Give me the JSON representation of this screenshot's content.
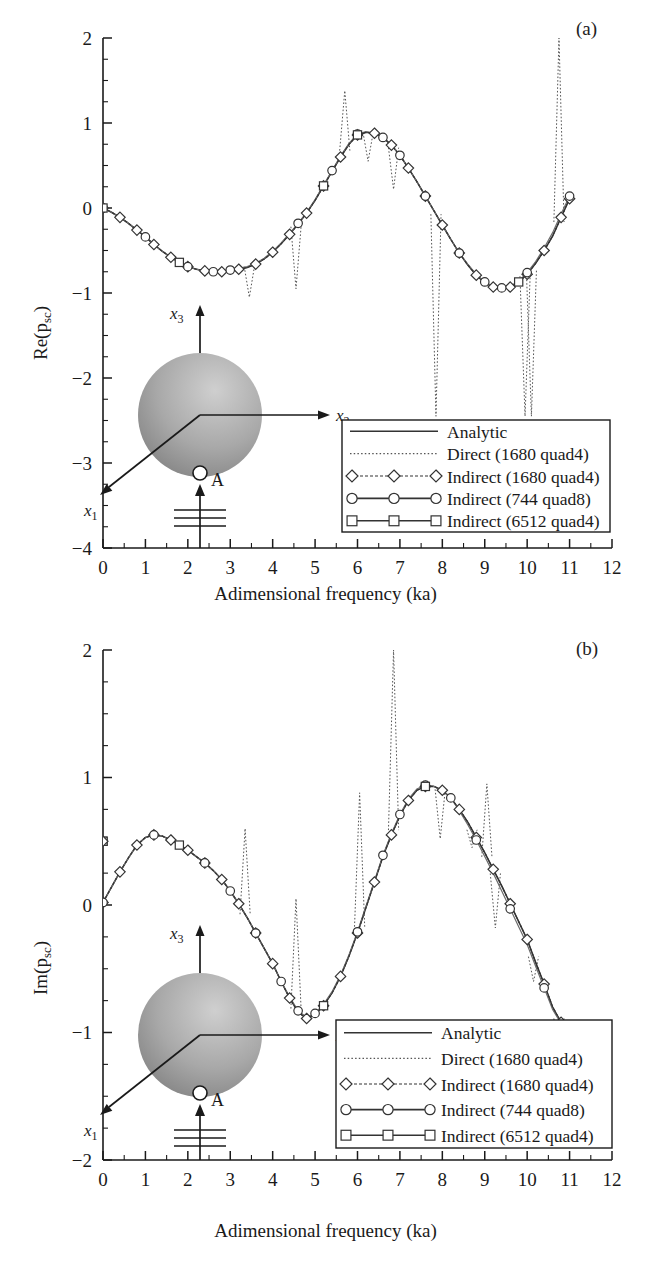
{
  "figure": {
    "panels": [
      {
        "id": "a",
        "label": "(a)",
        "ylabel_main": "Re(p",
        "ylabel_sub": "sc",
        "ylabel_close": ")",
        "xlabel": "Adimensional frequency (ka)"
      },
      {
        "id": "b",
        "label": "(b)",
        "ylabel_main": "Im(p",
        "ylabel_sub": "sc",
        "ylabel_close": ")",
        "xlabel": "Adimensional frequency (ka)"
      }
    ]
  },
  "legend": {
    "entries": [
      {
        "label": "Analytic",
        "style": "solid",
        "marker": "none"
      },
      {
        "label": "Direct (1680 quad4)",
        "style": "dotted",
        "marker": "none"
      },
      {
        "label": "Indirect (1680 quad4)",
        "style": "dashed",
        "marker": "diamond"
      },
      {
        "label": "Indirect (744 quad8)",
        "style": "solid",
        "marker": "circle"
      },
      {
        "label": "Indirect (6512 quad4)",
        "style": "solid",
        "marker": "square"
      }
    ]
  },
  "inset": {
    "axis_x1_main": "x",
    "axis_x1_sub": "1",
    "axis_x2_main": "x",
    "axis_x2_sub": "2",
    "axis_x3_main": "x",
    "axis_x3_sub": "3",
    "point_label": "A"
  },
  "colors": {
    "ink": "#1a1a1a",
    "curve": "#333333",
    "dotted": "#555555",
    "sphere_light": "#cfcfcf",
    "sphere_dark": "#7d7d7d"
  },
  "chart_data": [
    {
      "type": "line",
      "panel": "a",
      "title": "(a)",
      "xlabel": "Adimensional frequency (ka)",
      "ylabel": "Re(p_sc)",
      "xlim": [
        0,
        12
      ],
      "ylim": [
        -4,
        2
      ],
      "xticks": [
        0,
        1,
        2,
        3,
        4,
        5,
        6,
        7,
        8,
        9,
        10,
        11,
        12
      ],
      "yticks": [
        -4,
        -3,
        -2,
        -1,
        0,
        1,
        2
      ],
      "xminor_step": 0.5,
      "yminor_step": 0.25,
      "grid": false,
      "legend_position": "lower-right",
      "x": [
        0,
        0.2,
        0.4,
        0.6,
        0.8,
        1.0,
        1.2,
        1.4,
        1.6,
        1.8,
        2.0,
        2.2,
        2.4,
        2.6,
        2.8,
        3.0,
        3.2,
        3.4,
        3.6,
        3.8,
        4.0,
        4.2,
        4.4,
        4.6,
        4.8,
        5.0,
        5.2,
        5.4,
        5.6,
        5.8,
        6.0,
        6.2,
        6.4,
        6.6,
        6.8,
        7.0,
        7.2,
        7.4,
        7.6,
        7.8,
        8.0,
        8.2,
        8.4,
        8.6,
        8.8,
        9.0,
        9.2,
        9.4,
        9.6,
        9.8,
        10.0,
        10.2,
        10.4,
        10.6,
        10.8,
        11.0
      ],
      "series": [
        {
          "name": "Analytic",
          "values": [
            0.0,
            -0.05,
            -0.11,
            -0.18,
            -0.26,
            -0.34,
            -0.43,
            -0.51,
            -0.58,
            -0.64,
            -0.69,
            -0.72,
            -0.74,
            -0.75,
            -0.75,
            -0.74,
            -0.72,
            -0.7,
            -0.66,
            -0.6,
            -0.52,
            -0.42,
            -0.31,
            -0.19,
            -0.06,
            0.09,
            0.26,
            0.43,
            0.6,
            0.75,
            0.86,
            0.89,
            0.88,
            0.83,
            0.74,
            0.62,
            0.47,
            0.31,
            0.14,
            -0.03,
            -0.2,
            -0.37,
            -0.53,
            -0.67,
            -0.79,
            -0.88,
            -0.93,
            -0.95,
            -0.93,
            -0.87,
            -0.78,
            -0.65,
            -0.5,
            -0.33,
            -0.11,
            0.11
          ]
        },
        {
          "name": "Indirect (1680 quad4)",
          "values": [
            0.0,
            -0.05,
            -0.11,
            -0.18,
            -0.26,
            -0.34,
            -0.43,
            -0.51,
            -0.58,
            -0.64,
            -0.69,
            -0.72,
            -0.74,
            -0.75,
            -0.75,
            -0.74,
            -0.72,
            -0.7,
            -0.66,
            -0.6,
            -0.52,
            -0.42,
            -0.31,
            -0.19,
            -0.06,
            0.09,
            0.26,
            0.43,
            0.6,
            0.75,
            0.86,
            0.89,
            0.88,
            0.83,
            0.74,
            0.62,
            0.47,
            0.31,
            0.14,
            -0.03,
            -0.2,
            -0.37,
            -0.53,
            -0.67,
            -0.79,
            -0.88,
            -0.93,
            -0.95,
            -0.93,
            -0.87,
            -0.78,
            -0.65,
            -0.5,
            -0.33,
            -0.11,
            0.11
          ]
        },
        {
          "name": "Indirect (744 quad8)",
          "values": [
            0.0,
            -0.05,
            -0.11,
            -0.18,
            -0.26,
            -0.34,
            -0.43,
            -0.51,
            -0.58,
            -0.64,
            -0.69,
            -0.72,
            -0.74,
            -0.75,
            -0.74,
            -0.73,
            -0.71,
            -0.69,
            -0.65,
            -0.59,
            -0.51,
            -0.41,
            -0.3,
            -0.18,
            -0.05,
            0.1,
            0.27,
            0.44,
            0.61,
            0.76,
            0.87,
            0.9,
            0.88,
            0.83,
            0.74,
            0.62,
            0.47,
            0.31,
            0.14,
            -0.03,
            -0.2,
            -0.37,
            -0.53,
            -0.66,
            -0.78,
            -0.87,
            -0.92,
            -0.94,
            -0.92,
            -0.86,
            -0.76,
            -0.63,
            -0.47,
            -0.29,
            -0.07,
            0.14
          ]
        },
        {
          "name": "Indirect (6512 quad4)",
          "values": [
            0.0,
            -0.05,
            -0.11,
            -0.18,
            -0.26,
            -0.34,
            -0.43,
            -0.51,
            -0.58,
            -0.64,
            -0.69,
            -0.72,
            -0.74,
            -0.75,
            -0.75,
            -0.74,
            -0.72,
            -0.7,
            -0.66,
            -0.6,
            -0.52,
            -0.42,
            -0.31,
            -0.19,
            -0.06,
            0.09,
            0.26,
            0.43,
            0.6,
            0.75,
            0.86,
            0.89,
            0.88,
            0.83,
            0.74,
            0.62,
            0.47,
            0.31,
            0.14,
            -0.03,
            -0.2,
            -0.37,
            -0.53,
            -0.67,
            -0.79,
            -0.88,
            -0.93,
            -0.95,
            -0.93,
            -0.87,
            -0.78,
            -0.65,
            -0.5,
            -0.33,
            -0.11,
            0.11
          ]
        },
        {
          "name": "Direct (1680 quad4)",
          "note": "follows Analytic with sharp resonance spikes at irreducible frequencies",
          "spikes": [
            {
              "ka": 3.45,
              "to": -1.05
            },
            {
              "ka": 4.55,
              "to": -0.95
            },
            {
              "ka": 5.7,
              "to": 1.38
            },
            {
              "ka": 6.25,
              "to": 0.55
            },
            {
              "ka": 6.85,
              "to": 0.22
            },
            {
              "ka": 7.85,
              "to": -2.45
            },
            {
              "ka": 9.95,
              "to": -2.45
            },
            {
              "ka": 10.1,
              "to": -2.45
            },
            {
              "ka": 10.75,
              "to": 2.0
            }
          ]
        }
      ],
      "marker_x_diamond": [
        0,
        0.4,
        0.8,
        1.2,
        1.6,
        2.0,
        2.4,
        2.8,
        3.2,
        3.6,
        4.0,
        4.4,
        4.8,
        5.2,
        5.6,
        6.0,
        6.4,
        6.8,
        7.2,
        7.6,
        8.0,
        8.4,
        8.8,
        9.2,
        9.6,
        10.0,
        10.4,
        10.8,
        11.0
      ],
      "marker_x_circle": [
        0,
        1.0,
        2.0,
        2.6,
        3.0,
        4.6,
        5.4,
        6.0,
        6.6,
        7.0,
        7.6,
        8.4,
        9.0,
        9.4,
        10.0,
        11.0
      ],
      "marker_x_square": [
        0,
        1.8,
        5.2,
        6.0,
        9.8
      ]
    },
    {
      "type": "line",
      "panel": "b",
      "title": "(b)",
      "xlabel": "Adimensional frequency (ka)",
      "ylabel": "Im(p_sc)",
      "xlim": [
        0,
        12
      ],
      "ylim": [
        -2,
        2
      ],
      "xticks": [
        0,
        1,
        2,
        3,
        4,
        5,
        6,
        7,
        8,
        9,
        10,
        11,
        12
      ],
      "yticks": [
        -2,
        -1,
        0,
        1,
        2
      ],
      "xminor_step": 0.5,
      "yminor_step": 0.25,
      "grid": false,
      "legend_position": "lower-right",
      "x": [
        0,
        0.2,
        0.4,
        0.6,
        0.8,
        1.0,
        1.2,
        1.4,
        1.6,
        1.8,
        2.0,
        2.2,
        2.4,
        2.6,
        2.8,
        3.0,
        3.2,
        3.4,
        3.6,
        3.8,
        4.0,
        4.2,
        4.4,
        4.6,
        4.8,
        5.0,
        5.2,
        5.4,
        5.6,
        5.8,
        6.0,
        6.2,
        6.4,
        6.6,
        6.8,
        7.0,
        7.2,
        7.4,
        7.6,
        7.8,
        8.0,
        8.2,
        8.4,
        8.6,
        8.8,
        9.0,
        9.2,
        9.4,
        9.6,
        9.8,
        10.0,
        10.2,
        10.4,
        10.6,
        10.8,
        11.0
      ],
      "series": [
        {
          "name": "Analytic",
          "values": [
            0.02,
            0.14,
            0.26,
            0.37,
            0.47,
            0.53,
            0.55,
            0.54,
            0.51,
            0.47,
            0.43,
            0.38,
            0.33,
            0.27,
            0.2,
            0.11,
            0.01,
            -0.1,
            -0.22,
            -0.34,
            -0.46,
            -0.6,
            -0.73,
            -0.84,
            -0.89,
            -0.86,
            -0.79,
            -0.69,
            -0.56,
            -0.4,
            -0.22,
            -0.02,
            0.18,
            0.38,
            0.55,
            0.7,
            0.82,
            0.9,
            0.93,
            0.93,
            0.9,
            0.84,
            0.75,
            0.65,
            0.53,
            0.41,
            0.28,
            0.15,
            0.01,
            -0.13,
            -0.27,
            -0.45,
            -0.62,
            -0.8,
            -0.92,
            -0.98
          ]
        },
        {
          "name": "Indirect (1680 quad4)",
          "values": [
            0.02,
            0.14,
            0.26,
            0.37,
            0.47,
            0.53,
            0.55,
            0.54,
            0.51,
            0.47,
            0.43,
            0.38,
            0.33,
            0.27,
            0.2,
            0.11,
            0.01,
            -0.1,
            -0.22,
            -0.34,
            -0.46,
            -0.6,
            -0.73,
            -0.84,
            -0.89,
            -0.86,
            -0.79,
            -0.69,
            -0.56,
            -0.4,
            -0.22,
            -0.02,
            0.18,
            0.38,
            0.55,
            0.7,
            0.82,
            0.9,
            0.93,
            0.93,
            0.9,
            0.84,
            0.75,
            0.65,
            0.53,
            0.41,
            0.28,
            0.15,
            0.01,
            -0.13,
            -0.27,
            -0.45,
            -0.62,
            -0.8,
            -0.92,
            -0.98
          ]
        },
        {
          "name": "Indirect (744 quad8)",
          "values": [
            0.02,
            0.14,
            0.26,
            0.37,
            0.47,
            0.53,
            0.55,
            0.54,
            0.51,
            0.47,
            0.43,
            0.38,
            0.33,
            0.27,
            0.2,
            0.11,
            0.01,
            -0.1,
            -0.22,
            -0.34,
            -0.46,
            -0.6,
            -0.72,
            -0.83,
            -0.88,
            -0.85,
            -0.78,
            -0.68,
            -0.55,
            -0.39,
            -0.21,
            -0.01,
            0.19,
            0.39,
            0.56,
            0.71,
            0.83,
            0.91,
            0.94,
            0.93,
            0.9,
            0.84,
            0.74,
            0.63,
            0.51,
            0.38,
            0.25,
            0.11,
            -0.03,
            -0.17,
            -0.31,
            -0.48,
            -0.65,
            -0.82,
            -0.93,
            -0.97
          ]
        },
        {
          "name": "Indirect (6512 quad4)",
          "values": [
            0.5,
            0.14,
            0.26,
            0.37,
            0.47,
            0.53,
            0.55,
            0.54,
            0.51,
            0.47,
            0.43,
            0.38,
            0.33,
            0.27,
            0.2,
            0.11,
            0.01,
            -0.1,
            -0.22,
            -0.34,
            -0.46,
            -0.6,
            -0.73,
            -0.84,
            -0.89,
            -0.86,
            -0.79,
            -0.69,
            -0.56,
            -0.4,
            -0.22,
            -0.02,
            0.18,
            0.38,
            0.55,
            0.7,
            0.82,
            0.9,
            0.93,
            0.93,
            0.9,
            0.84,
            0.75,
            0.65,
            0.53,
            0.41,
            0.28,
            0.15,
            0.01,
            -0.13,
            -0.27,
            -0.45,
            -0.62,
            -0.8,
            -0.92,
            -0.98
          ]
        },
        {
          "name": "Direct (1680 quad4)",
          "note": "follows Analytic with sharp resonance spikes",
          "spikes": [
            {
              "ka": 3.35,
              "to": 0.6
            },
            {
              "ka": 4.55,
              "to": 0.05
            },
            {
              "ka": 6.05,
              "to": 0.88
            },
            {
              "ka": 6.85,
              "to": 2.0
            },
            {
              "ka": 7.95,
              "to": 0.52
            },
            {
              "ka": 8.7,
              "to": 0.45
            },
            {
              "ka": 9.05,
              "to": 0.95
            },
            {
              "ka": 9.25,
              "to": -0.18
            },
            {
              "ka": 10.15,
              "to": -0.6
            },
            {
              "ka": 10.75,
              "to": -1.3
            }
          ]
        }
      ],
      "marker_x_diamond": [
        0,
        0.4,
        0.8,
        1.2,
        1.6,
        2.0,
        2.4,
        2.8,
        3.2,
        3.6,
        4.0,
        4.4,
        4.8,
        5.2,
        5.6,
        6.0,
        6.4,
        6.8,
        7.2,
        7.6,
        8.0,
        8.4,
        8.8,
        9.2,
        9.6,
        10.0,
        10.4,
        10.8,
        11.0
      ],
      "marker_x_circle": [
        0,
        1.2,
        2.4,
        3.0,
        3.6,
        4.2,
        4.6,
        5.0,
        6.0,
        6.6,
        7.0,
        7.6,
        8.2,
        8.8,
        9.6,
        10.4,
        11.0
      ],
      "marker_x_square": [
        0,
        1.8,
        5.2,
        7.6
      ],
      "extra_square_point": {
        "ka": 0.0,
        "value": 0.5
      }
    }
  ]
}
